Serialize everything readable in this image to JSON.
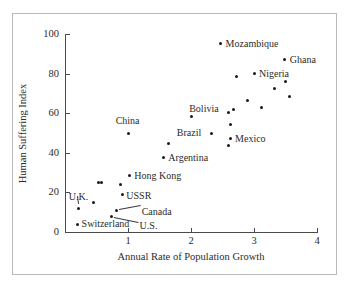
{
  "figure": {
    "border_color": "#b9b9b9",
    "background": "#ffffff",
    "axis_color": "#4a4a4a",
    "marker_color": "#1a1a1a"
  },
  "chart_data": {
    "type": "scatter",
    "title": "",
    "xlabel": "Annual Rate of Population Growth",
    "ylabel": "Human Suffering Index",
    "xlim": [
      0,
      4
    ],
    "ylim": [
      0,
      100
    ],
    "xticks": [
      1,
      2,
      3,
      4
    ],
    "yticks": [
      0,
      20,
      40,
      60,
      80,
      100
    ],
    "grid": false,
    "legend": "none",
    "points": [
      {
        "label": "Switzerland",
        "x": 0.2,
        "y": 4
      },
      {
        "label": "U.K.",
        "x": 0.22,
        "y": 12
      },
      {
        "label": "",
        "x": 0.45,
        "y": 15
      },
      {
        "label": "",
        "x": 0.53,
        "y": 25
      },
      {
        "label": "",
        "x": 0.58,
        "y": 25
      },
      {
        "label": "U.S.",
        "x": 0.74,
        "y": 8
      },
      {
        "label": "Canada",
        "x": 0.82,
        "y": 11
      },
      {
        "label": "USSR",
        "x": 0.91,
        "y": 19
      },
      {
        "label": "",
        "x": 0.88,
        "y": 24
      },
      {
        "label": "Hong Kong",
        "x": 1.02,
        "y": 28.5
      },
      {
        "label": "China",
        "x": 1.01,
        "y": 50
      },
      {
        "label": "Argentina",
        "x": 1.56,
        "y": 37.5
      },
      {
        "label": "",
        "x": 1.64,
        "y": 44.5
      },
      {
        "label": "",
        "x": 2.0,
        "y": 58.5
      },
      {
        "label": "Brazil",
        "x": 2.33,
        "y": 50
      },
      {
        "label": "",
        "x": 2.47,
        "y": 95
      },
      {
        "label": "",
        "x": 2.6,
        "y": 43.5
      },
      {
        "label": "Mexico",
        "x": 2.62,
        "y": 47
      },
      {
        "label": "",
        "x": 2.62,
        "y": 54.5
      },
      {
        "label": "",
        "x": 2.6,
        "y": 60.5
      },
      {
        "label": "Bolivia",
        "x": 2.67,
        "y": 62
      },
      {
        "label": "",
        "x": 2.72,
        "y": 78.5
      },
      {
        "label": "",
        "x": 2.89,
        "y": 66.5
      },
      {
        "label": "Nigeria",
        "x": 3.0,
        "y": 80
      },
      {
        "label": "",
        "x": 3.12,
        "y": 63
      },
      {
        "label": "",
        "x": 3.33,
        "y": 72.5
      },
      {
        "label": "Ghana",
        "x": 3.49,
        "y": 87
      },
      {
        "label": "",
        "x": 3.5,
        "y": 76
      },
      {
        "label": "",
        "x": 3.57,
        "y": 68.5
      },
      {
        "label": "Mozambique",
        "x": 2.47,
        "y": 95
      }
    ],
    "annotations": [
      {
        "text": "Mozambique",
        "x": 2.47,
        "y": 95,
        "anchor": "right"
      },
      {
        "text": "Ghana",
        "x": 3.49,
        "y": 87,
        "anchor": "right"
      },
      {
        "text": "Nigeria",
        "x": 3.0,
        "y": 80,
        "anchor": "right"
      },
      {
        "text": "Bolivia",
        "x": 2.67,
        "y": 62,
        "anchor": "left"
      },
      {
        "text": "Mexico",
        "x": 2.62,
        "y": 47,
        "anchor": "right"
      },
      {
        "text": "Brazil",
        "x": 2.33,
        "y": 50,
        "anchor": "left"
      },
      {
        "text": "China",
        "x": 1.01,
        "y": 50,
        "anchor": "above"
      },
      {
        "text": "Argentina",
        "x": 1.56,
        "y": 37.5,
        "anchor": "right"
      },
      {
        "text": "Hong Kong",
        "x": 1.02,
        "y": 28.5,
        "anchor": "right"
      },
      {
        "text": "USSR",
        "x": 0.91,
        "y": 19,
        "anchor": "right"
      },
      {
        "text": "Canada",
        "x": 0.82,
        "y": 11,
        "anchor": "leader"
      },
      {
        "text": "U.S.",
        "x": 0.74,
        "y": 8,
        "anchor": "leader"
      },
      {
        "text": "U.K.",
        "x": 0.22,
        "y": 12,
        "anchor": "leader"
      },
      {
        "text": "Switzerland",
        "x": 0.2,
        "y": 4,
        "anchor": "right"
      }
    ]
  },
  "axes": {
    "x_title": "Annual Rate of Population Growth",
    "y_title": "Human Suffering Index",
    "x_tick_labels": [
      "1",
      "2",
      "3",
      "4"
    ],
    "y_tick_labels": [
      "0",
      "20",
      "40",
      "60",
      "80",
      "100"
    ]
  }
}
